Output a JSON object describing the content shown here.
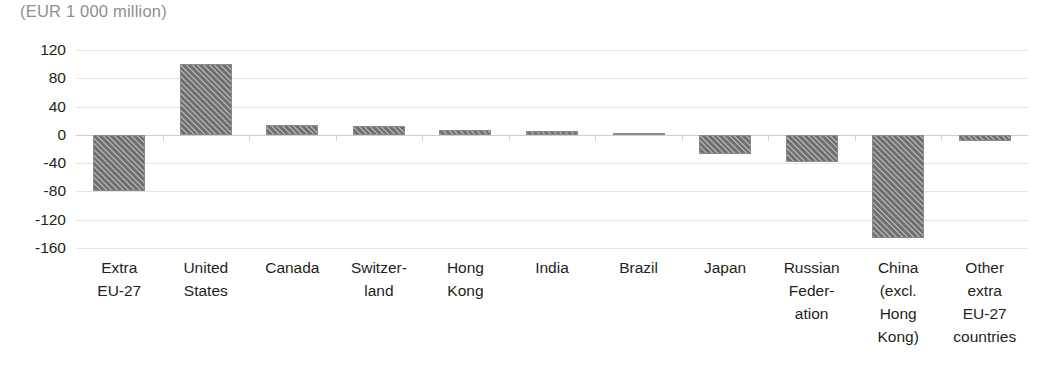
{
  "chart_data": {
    "type": "bar",
    "title": "(EUR 1 000 million)",
    "xlabel": "",
    "ylabel": "",
    "ylim": [
      -160,
      120
    ],
    "yticks": [
      120,
      80,
      40,
      0,
      -40,
      -80,
      -120,
      -160
    ],
    "ytick_labels": [
      "120",
      "80",
      "40",
      "0",
      "-40",
      "-80",
      "-120",
      "-160"
    ],
    "grid": true,
    "legend": "none",
    "categories": [
      "Extra EU-27",
      "United States",
      "Canada",
      "Switzerland",
      "Hong Kong",
      "India",
      "Brazil",
      "Japan",
      "Russian Federation",
      "China (excl. Hong Kong)",
      "Other extra EU-27 countries"
    ],
    "category_label_lines": [
      [
        "Extra",
        "EU-27"
      ],
      [
        "United",
        "States"
      ],
      [
        "Canada"
      ],
      [
        "Switzer-",
        "land"
      ],
      [
        "Hong",
        "Kong"
      ],
      [
        "India"
      ],
      [
        "Brazil"
      ],
      [
        "Japan"
      ],
      [
        "Russian",
        "Feder-",
        "ation"
      ],
      [
        "China",
        "(excl.",
        "Hong",
        "Kong)"
      ],
      [
        "Other",
        "extra",
        "EU-27",
        "countries"
      ]
    ],
    "values": [
      -80,
      100,
      14,
      13,
      7,
      6,
      2,
      -27,
      -38,
      -146,
      -8
    ],
    "series": [
      {
        "name": "Balance",
        "values": [
          -80,
          100,
          14,
          13,
          7,
          6,
          2,
          -27,
          -38,
          -146,
          -8
        ]
      }
    ],
    "colors": {
      "bar_fill": "#707070",
      "bar_hatch": "#ffffff",
      "gridline": "#e3e3e3",
      "zero_line": "#cfcfcf",
      "title_text": "#8e8e8e",
      "tick_text": "#231f20"
    }
  }
}
